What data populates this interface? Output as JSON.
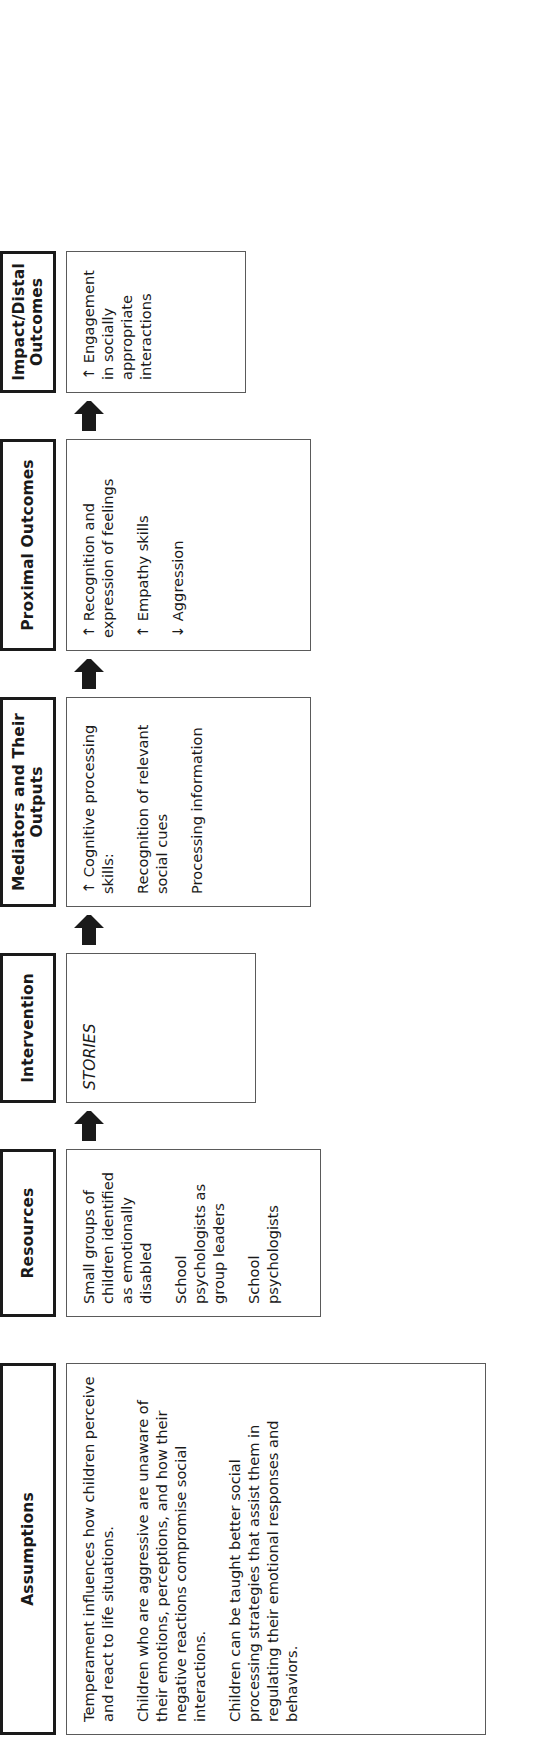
{
  "figure": {
    "type": "logic-model-flow-diagram",
    "orientation": "rotated-90-counterclockwise",
    "columns": [
      {
        "id": "assumptions",
        "header": "Assumptions",
        "entries": [
          "Temperament influences how children perceive and react to life situations.",
          "Children who are aggressive are unaware of their emotions, perceptions, and how their negative reactions compromise social interactions.",
          "Children can be taught better social processing strategies that assist them in regulating their emotional responses and behaviors."
        ]
      },
      {
        "id": "resources",
        "header": "Resources",
        "entries": [
          "Small groups of children identified as emotionally disabled",
          "School psychologists as group leaders",
          "School psychologists"
        ]
      },
      {
        "id": "intervention",
        "header": "Intervention",
        "entries": [
          "STORIES"
        ]
      },
      {
        "id": "mediators",
        "header": "Mediators and Their Outputs",
        "entries": [
          "↑ Cognitive processing skills:",
          "Recognition of relevant social cues",
          "Processing information"
        ]
      },
      {
        "id": "proximal",
        "header": "Proximal Outcomes",
        "entries": [
          "↑ Recognition and expression of feelings",
          "↑ Empathy skills",
          "↓ Aggression"
        ]
      },
      {
        "id": "impact",
        "header": "Impact/Distal Outcomes",
        "entries": [
          "↑ Engagement in socially appropriate interactions"
        ]
      }
    ],
    "connectors": [
      {
        "id": "resources-to-intervention",
        "glyph": "up-arrow"
      },
      {
        "id": "intervention-to-mediators",
        "glyph": "up-arrow"
      },
      {
        "id": "mediators-to-proximal",
        "glyph": "up-arrow"
      },
      {
        "id": "proximal-to-impact",
        "glyph": "up-arrow"
      }
    ],
    "colors": {
      "background": "#ffffff",
      "text": "#1a1a1a",
      "header_border": "#1a1a1a",
      "body_border": "#5a5a5a",
      "arrow_fill": "#1a1a1a"
    }
  }
}
